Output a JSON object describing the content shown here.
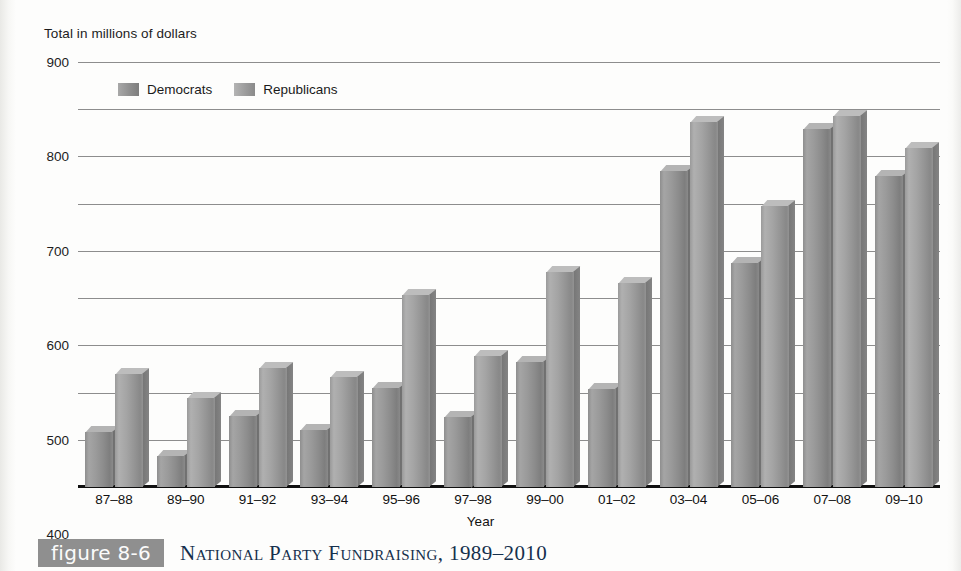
{
  "axis_title": "Total in millions of dollars",
  "xaxis_label": "Year",
  "legend": {
    "democrats": "Democrats",
    "republicans": "Republicans"
  },
  "caption": {
    "badge": "figure 8-6",
    "title": "National Party Fundraising, 1989–2010"
  },
  "colors": {
    "democrat_bar": "#8e8e8e",
    "republican_bar": "#9a9a9a",
    "gridline": "#8d8d8d",
    "baseline": "#101010",
    "badge_bg": "#8f8f8f",
    "caption_text": "#15304d"
  },
  "chart_data": {
    "type": "bar",
    "title": "National Party Fundraising, 1989–2010",
    "subtitle": "Total in millions of dollars",
    "xlabel": "Year",
    "ylabel": "Total in millions of dollars",
    "ylim": [
      0,
      900
    ],
    "yticks": [
      0,
      100,
      200,
      300,
      400,
      500,
      600,
      700,
      800,
      900
    ],
    "ytick_labels": [
      "0",
      "100",
      "200",
      "300",
      "400",
      "500",
      "600",
      "700",
      "800",
      "900"
    ],
    "grid": true,
    "legend_position": "top-left-inside",
    "categories": [
      "87–88",
      "89–90",
      "91–92",
      "93–94",
      "95–96",
      "97–98",
      "99–00",
      "01–02",
      "03–04",
      "05–06",
      "07–08",
      "09–10"
    ],
    "series": [
      {
        "name": "Democrats",
        "values": [
          130,
          78,
          163,
          134,
          223,
          162,
          278,
          221,
          682,
          488,
          770,
          672
        ]
      },
      {
        "name": "Republicans",
        "values": [
          251,
          202,
          265,
          246,
          419,
          290,
          469,
          445,
          786,
          607,
          799,
          730
        ]
      }
    ]
  }
}
